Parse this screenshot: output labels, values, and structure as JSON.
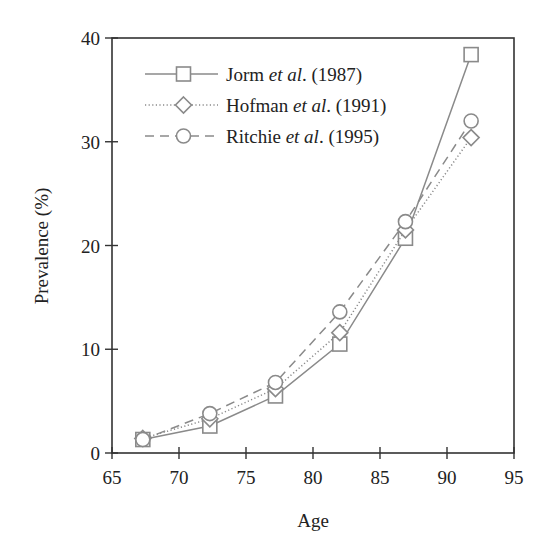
{
  "chart_data": {
    "type": "line",
    "title": "",
    "xlabel": "Age",
    "ylabel": "Prevalence (%)",
    "xlim": [
      65,
      95
    ],
    "ylim": [
      0,
      40
    ],
    "xticks": [
      65,
      70,
      75,
      80,
      85,
      90,
      95
    ],
    "yticks": [
      0,
      10,
      20,
      30,
      40
    ],
    "grid": false,
    "legend_position": "upper left",
    "x": [
      67.3,
      72.3,
      77.2,
      82.0,
      86.9,
      91.8
    ],
    "series": [
      {
        "name": "Jorm et al. (1987)",
        "author": "Jorm",
        "etal": "et al",
        "year": ". (1987)",
        "marker": "square",
        "linestyle": "solid",
        "values": [
          1.3,
          2.6,
          5.5,
          10.5,
          20.7,
          38.4
        ]
      },
      {
        "name": "Hofman et al. (1991)",
        "author": "Hofman",
        "etal": "et al",
        "year": ". (1991)",
        "marker": "diamond",
        "linestyle": "dotted",
        "values": [
          1.4,
          3.3,
          6.2,
          11.6,
          21.5,
          30.4
        ]
      },
      {
        "name": "Ritchie et al. (1995)",
        "author": "Ritchie",
        "etal": "et al",
        "year": ". (1995)",
        "marker": "circle",
        "linestyle": "dashed",
        "values": [
          1.3,
          3.8,
          6.8,
          13.6,
          22.3,
          32.0
        ]
      }
    ],
    "colors": {
      "axis": "#333333",
      "series": "#8a8a8a"
    }
  }
}
